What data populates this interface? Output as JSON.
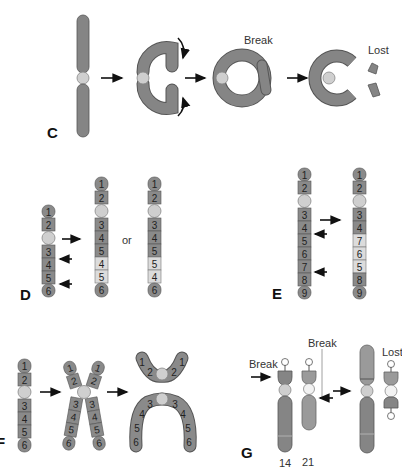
{
  "figure": {
    "panels": [
      {
        "id": "C",
        "label": "C",
        "description": "Ring chromosome formation",
        "annotations": [
          "Break",
          "Lost"
        ]
      },
      {
        "id": "D",
        "label": "D",
        "description": "Paracentric inversion",
        "or_label": "or",
        "original_bands": [
          "1",
          "2",
          "3",
          "4",
          "5",
          "6"
        ],
        "result_a_bands": [
          "1",
          "2",
          "3",
          "4",
          "5",
          "4",
          "5",
          "6"
        ],
        "result_b_bands": [
          "1",
          "2",
          "3",
          "4",
          "5",
          "5",
          "4",
          "6"
        ]
      },
      {
        "id": "E",
        "label": "E",
        "description": "Inversion",
        "original_bands": [
          "1",
          "2",
          "3",
          "4",
          "5",
          "6",
          "7",
          "8",
          "9"
        ],
        "result_bands": [
          "1",
          "2",
          "3",
          "4",
          "7",
          "6",
          "5",
          "8",
          "9"
        ]
      },
      {
        "id": "F",
        "label": "F",
        "description": "Isochromosome formation",
        "bands": [
          "1",
          "2",
          "3",
          "4",
          "5",
          "6"
        ]
      },
      {
        "id": "G",
        "label": "G",
        "description": "Robertsonian translocation",
        "annotations": [
          "Break",
          "Break",
          "Lost"
        ],
        "chromosome_labels": [
          "14",
          "21"
        ]
      }
    ]
  },
  "text": {
    "c_label": "C",
    "c_break": "Break",
    "c_lost": "Lost",
    "d_label": "D",
    "d_or": "or",
    "e_label": "E",
    "f_label": "F",
    "g_label": "G",
    "g_break1": "Break",
    "g_break2": "Break",
    "g_lost": "Lost",
    "g_chr14": "14",
    "g_chr21": "21"
  },
  "colors": {
    "chromosome": "#858585",
    "centromere": "#cfcfcf",
    "highlight_band": "#dcdcdc",
    "arrow": "#111111"
  }
}
